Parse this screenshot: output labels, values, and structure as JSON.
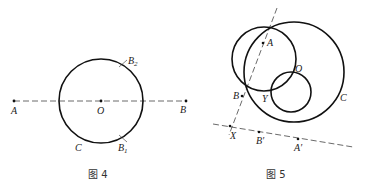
{
  "figures": [
    {
      "caption": "图 4",
      "points": {
        "A": {
          "label": "A",
          "x": 14,
          "y": 101
        },
        "B": {
          "label": "B",
          "x": 186,
          "y": 101
        },
        "O": {
          "label": "O",
          "x": 100,
          "y": 101
        },
        "B1": {
          "label": "B",
          "sub": "1",
          "x": 123,
          "y": 138
        },
        "B2": {
          "label": "B",
          "sub": "2",
          "x": 123,
          "y": 63
        }
      },
      "circle_label": "C"
    },
    {
      "caption": "图 5",
      "points": {
        "A": {
          "label": "A"
        },
        "B": {
          "label": "B"
        },
        "O": {
          "label": "O"
        },
        "Y": {
          "label": "Y"
        },
        "X": {
          "label": "X"
        },
        "B_prime": {
          "label": "B′"
        },
        "A_prime": {
          "label": "A′"
        }
      },
      "circle_label": "C"
    }
  ]
}
